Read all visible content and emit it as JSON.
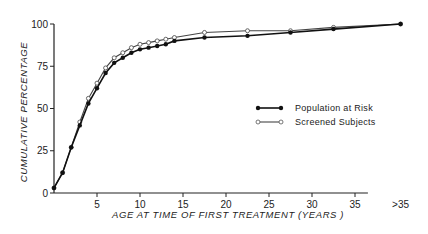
{
  "chart_data": {
    "type": "line",
    "title": "",
    "xlabel": "AGE AT TIME OF FIRST TREATMENT (YEARS )",
    "ylabel": "CUMULATIVE PERCENTAGE",
    "ylim": [
      0,
      100
    ],
    "xlim": [
      0,
      40
    ],
    "grid": false,
    "legend_position": "center-right",
    "x_ticks": [
      {
        "value": 5,
        "label": "5"
      },
      {
        "value": 10,
        "label": "10"
      },
      {
        "value": 15,
        "label": "15"
      },
      {
        "value": 20,
        "label": "20"
      },
      {
        "value": 25,
        "label": "25"
      },
      {
        "value": 30,
        "label": "30"
      },
      {
        "value": 35,
        "label": "35"
      },
      {
        "value": 40.3,
        "label": ">35"
      }
    ],
    "y_ticks": [
      {
        "value": 0,
        "label": "0"
      },
      {
        "value": 25,
        "label": "25"
      },
      {
        "value": 50,
        "label": "50"
      },
      {
        "value": 75,
        "label": "75"
      },
      {
        "value": 100,
        "label": "100"
      }
    ],
    "series": [
      {
        "name": "Population at Risk",
        "marker": "filled-circle",
        "color": "#111111",
        "x": [
          0,
          1,
          2,
          3,
          4,
          5,
          6,
          7,
          8,
          9,
          10,
          11,
          12,
          13,
          14,
          17.5,
          22.5,
          27.5,
          32.5,
          40.3
        ],
        "values": [
          3,
          12,
          27,
          40,
          53,
          62,
          71,
          77,
          80,
          83,
          85,
          86,
          87,
          88,
          90,
          92,
          93,
          95,
          97,
          100
        ]
      },
      {
        "name": "Screened Subjects",
        "marker": "open-circle",
        "color": "#111111",
        "x": [
          0,
          1,
          2,
          3,
          4,
          5,
          6,
          7,
          8,
          9,
          10,
          11,
          12,
          13,
          14,
          17.5,
          22.5,
          27.5,
          32.5,
          40.3
        ],
        "values": [
          3,
          12,
          27,
          42,
          56,
          65,
          74,
          80,
          83,
          86,
          88,
          89,
          90,
          91,
          92,
          95,
          96,
          96,
          98,
          100
        ]
      }
    ]
  }
}
